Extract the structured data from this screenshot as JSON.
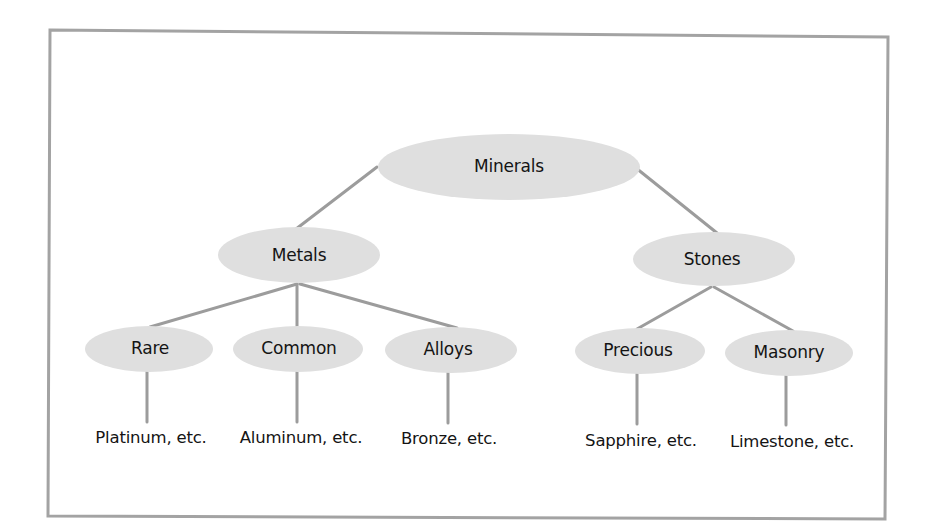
{
  "diagram": {
    "type": "hierarchy-tree",
    "colors": {
      "background": "#ffffff",
      "frame": "#a3a3a3",
      "node_fill": "#dfdfdf",
      "connector": "#9c9c9c",
      "text": "#141414"
    },
    "root": {
      "id": "minerals",
      "label": "Minerals",
      "cx": 509,
      "cy": 167,
      "rx": 131,
      "ry": 33
    },
    "categories": [
      {
        "id": "metals",
        "label": "Metals",
        "cx": 299,
        "cy": 255,
        "rx": 81,
        "ry": 28
      },
      {
        "id": "stones",
        "label": "Stones",
        "cx": 714,
        "cy": 259,
        "rx": 81,
        "ry": 27
      }
    ],
    "subcategories": [
      {
        "id": "rare",
        "parent": "metals",
        "label": "Rare",
        "cx": 149,
        "cy": 349,
        "rx": 64,
        "ry": 23
      },
      {
        "id": "common",
        "parent": "metals",
        "label": "Common",
        "cx": 298,
        "cy": 349,
        "rx": 65,
        "ry": 23
      },
      {
        "id": "alloys",
        "parent": "metals",
        "label": "Alloys",
        "cx": 451,
        "cy": 350,
        "rx": 66,
        "ry": 23
      },
      {
        "id": "precious",
        "parent": "stones",
        "label": "Precious",
        "cx": 640,
        "cy": 351,
        "rx": 65,
        "ry": 23
      },
      {
        "id": "masonry",
        "parent": "stones",
        "label": "Masonry",
        "cx": 789,
        "cy": 353,
        "rx": 64,
        "ry": 23
      }
    ],
    "examples": [
      {
        "parent": "rare",
        "label": "Platinum, etc.",
        "x": 151,
        "y": 437
      },
      {
        "parent": "common",
        "label": "Aluminum, etc.",
        "x": 299,
        "y": 437
      },
      {
        "parent": "alloys",
        "label": "Bronze, etc.",
        "x": 449,
        "y": 438
      },
      {
        "parent": "precious",
        "label": "Sapphire, etc.",
        "x": 641,
        "y": 440
      },
      {
        "parent": "masonry",
        "label": "Limestone, etc.",
        "x": 792,
        "y": 441
      }
    ]
  }
}
